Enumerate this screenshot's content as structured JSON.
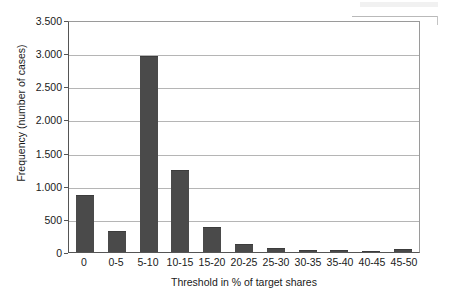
{
  "chart_data": {
    "type": "bar",
    "title": "",
    "subtitle": "",
    "xlabel": "Threshold in % of target shares",
    "ylabel": "Frequency (number of cases)",
    "categories": [
      "0",
      "0-5",
      "5-10",
      "10-15",
      "15-20",
      "20-25",
      "25-30",
      "30-35",
      "35-40",
      "40-45",
      "45-50"
    ],
    "values": [
      865,
      320,
      2950,
      1240,
      375,
      125,
      60,
      35,
      25,
      10,
      45
    ],
    "series": [
      {
        "name": "Frequency (number of cases)",
        "values": [
          865,
          320,
          2950,
          1240,
          375,
          125,
          60,
          35,
          25,
          10,
          45
        ]
      }
    ],
    "ylim": [
      0,
      3500
    ],
    "y_ticks": [
      0,
      500,
      1000,
      1500,
      2000,
      2500,
      3000,
      3500
    ],
    "y_tick_labels": [
      "0",
      "500",
      "1.000",
      "1.500",
      "2.000",
      "2.500",
      "3.000",
      "3.500"
    ],
    "grid": true,
    "grid_axis": "y",
    "legend": false,
    "legend_position": "none",
    "bar_color": "#4a4a4a",
    "plot_background": "#ffffff",
    "gridline_color": "#b5b5b5",
    "axis_color": "#555555"
  }
}
